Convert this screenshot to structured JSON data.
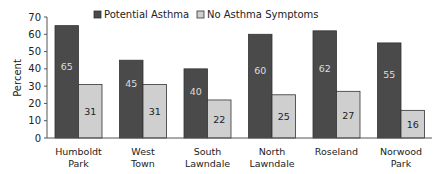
{
  "chart_data": {
    "type": "bar",
    "title": "",
    "xlabel": "",
    "ylabel": "Percent",
    "ylim": [
      0,
      70
    ],
    "yticks": [
      0,
      10,
      20,
      30,
      40,
      50,
      60,
      70
    ],
    "grid": false,
    "legend_position": "top",
    "categories": [
      [
        "Humboldt",
        "Park"
      ],
      [
        "West",
        "Town"
      ],
      [
        "South",
        "Lawndale"
      ],
      [
        "North",
        "Lawndale"
      ],
      [
        "Roseland"
      ],
      [
        "Norwood",
        "Park"
      ]
    ],
    "series": [
      {
        "name": "Potential Asthma",
        "color": "#4a4a4a",
        "label_color": "#dddddd",
        "values": [
          65,
          45,
          40,
          60,
          62,
          55
        ]
      },
      {
        "name": "No Asthma Symptoms",
        "color": "#cfcfcf",
        "label_color": "#222222",
        "values": [
          31,
          31,
          22,
          25,
          27,
          16
        ]
      }
    ]
  }
}
